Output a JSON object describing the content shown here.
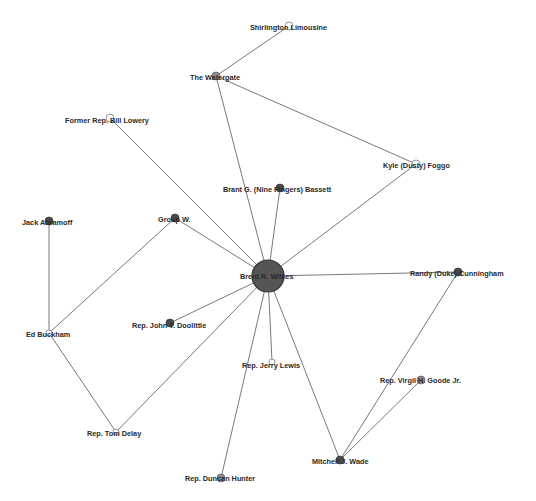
{
  "diagram": {
    "type": "network-graph",
    "nodes": [
      {
        "id": "wilkes",
        "label": "Brent R. Wilkes",
        "x": 268,
        "y": 276,
        "r": 16,
        "style": "hub",
        "lx": 240,
        "ly": 279
      },
      {
        "id": "shirlington",
        "label": "Shirlington Limousine",
        "x": 289,
        "y": 26,
        "r": 4,
        "style": "light",
        "lx": 250,
        "ly": 30
      },
      {
        "id": "watergate",
        "label": "The Watergate",
        "x": 216,
        "y": 76,
        "r": 4,
        "style": "gray",
        "lx": 190,
        "ly": 80
      },
      {
        "id": "lowery",
        "label": "Former Rep. Bill Lowery",
        "x": 110,
        "y": 118,
        "r": 4,
        "style": "light",
        "lx": 65,
        "ly": 123
      },
      {
        "id": "foggo",
        "label": "Kyle (Dusty) Foggo",
        "x": 416,
        "y": 164,
        "r": 4,
        "style": "light",
        "lx": 383,
        "ly": 168
      },
      {
        "id": "bassett",
        "label": "Brant G. (Nine Fingers) Bassett",
        "x": 280,
        "y": 188,
        "r": 4,
        "style": "dark",
        "lx": 223,
        "ly": 192
      },
      {
        "id": "abramoff",
        "label": "Jack Abramoff",
        "x": 49,
        "y": 221,
        "r": 4,
        "style": "dark",
        "lx": 22,
        "ly": 225
      },
      {
        "id": "groupw",
        "label": "Group W.",
        "x": 175,
        "y": 218,
        "r": 4,
        "style": "dark",
        "lx": 158,
        "ly": 222
      },
      {
        "id": "cunningham",
        "label": "Randy (Duke) Cunningham",
        "x": 458,
        "y": 272,
        "r": 4,
        "style": "dark",
        "lx": 410,
        "ly": 276
      },
      {
        "id": "buckham",
        "label": "Ed Buckham",
        "x": 49,
        "y": 333,
        "r": 3,
        "style": "light",
        "lx": 26,
        "ly": 337
      },
      {
        "id": "doolittle",
        "label": "Rep. John T. Doolittle",
        "x": 170,
        "y": 323,
        "r": 4,
        "style": "dark",
        "lx": 132,
        "ly": 328
      },
      {
        "id": "lewis",
        "label": "Rep. Jerry Lewis",
        "x": 272,
        "y": 362,
        "r": 3,
        "style": "light",
        "lx": 242,
        "ly": 368
      },
      {
        "id": "goode",
        "label": "Rep. Virgil H. Goode Jr.",
        "x": 421,
        "y": 380,
        "r": 4,
        "style": "gray",
        "lx": 380,
        "ly": 383
      },
      {
        "id": "delay",
        "label": "Rep. Tom Delay",
        "x": 116,
        "y": 432,
        "r": 3,
        "style": "light",
        "lx": 87,
        "ly": 436
      },
      {
        "id": "wade",
        "label": "Mitchell J. Wade",
        "x": 340,
        "y": 460,
        "r": 4,
        "style": "dark",
        "lx": 312,
        "ly": 464
      },
      {
        "id": "hunter",
        "label": "Rep. Duncan Hunter",
        "x": 221,
        "y": 478,
        "r": 4,
        "style": "gray",
        "lx": 185,
        "ly": 481
      }
    ],
    "edges": [
      [
        "shirlington",
        "watergate"
      ],
      [
        "watergate",
        "wilkes"
      ],
      [
        "watergate",
        "foggo"
      ],
      [
        "foggo",
        "wilkes"
      ],
      [
        "lowery",
        "wilkes"
      ],
      [
        "bassett",
        "wilkes"
      ],
      [
        "groupw",
        "wilkes"
      ],
      [
        "groupw",
        "buckham"
      ],
      [
        "abramoff",
        "buckham"
      ],
      [
        "buckham",
        "delay"
      ],
      [
        "delay",
        "wilkes"
      ],
      [
        "doolittle",
        "wilkes"
      ],
      [
        "cunningham",
        "wilkes"
      ],
      [
        "cunningham",
        "wade"
      ],
      [
        "lewis",
        "wilkes"
      ],
      [
        "hunter",
        "wilkes"
      ],
      [
        "wade",
        "wilkes"
      ],
      [
        "goode",
        "wade"
      ]
    ]
  }
}
